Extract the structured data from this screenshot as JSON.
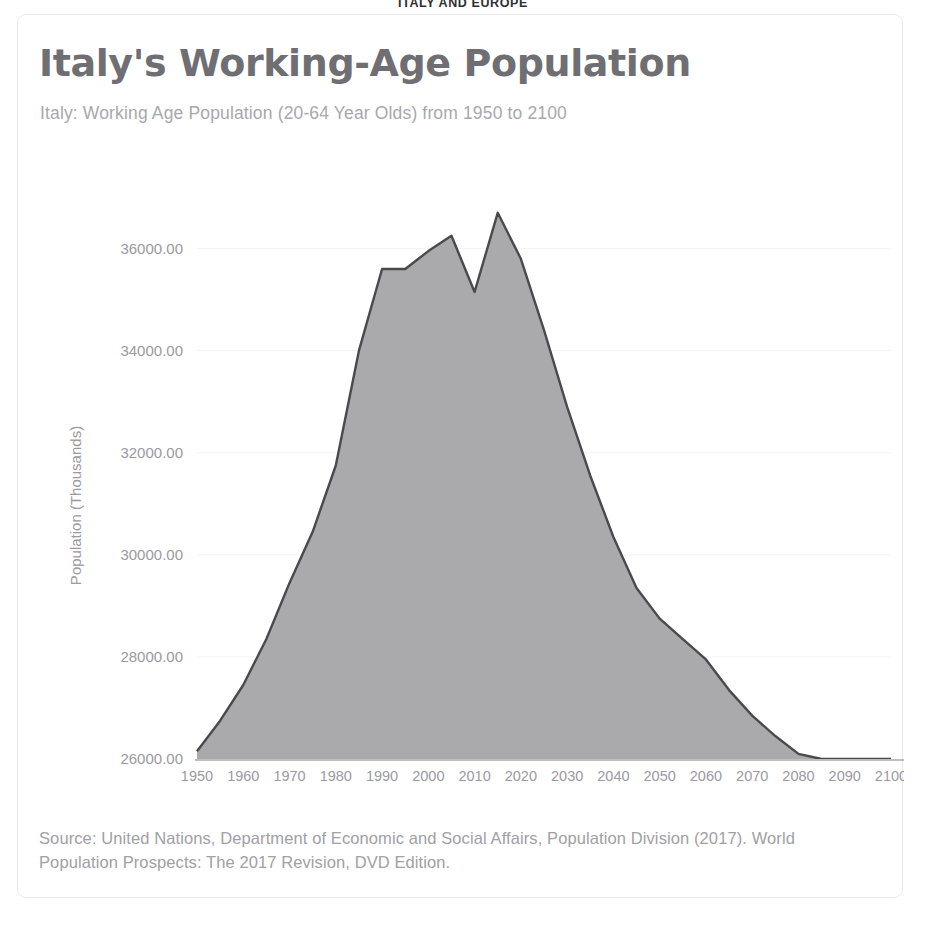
{
  "banner": {
    "text": "ITALY AND EUROPE"
  },
  "card": {
    "title": "Italy's Working-Age Population",
    "subtitle": "Italy: Working Age Population (20-64 Year Olds) from 1950 to 2100",
    "source": "Source: United Nations, Department of Economic and Social Affairs, Population Division (2017). World Population Prospects: The 2017 Revision, DVD Edition."
  },
  "colors": {
    "title": "#6e6e73",
    "subtitle": "#a8a8ad",
    "area_fill": "#a3a3a6",
    "line_stroke": "#4a4a4e",
    "axis": "#bdbdc2",
    "gridline": "#f4f4f6",
    "tick_text": "#9a9a9f",
    "card_border": "#e9e9ec",
    "background": "#ffffff"
  },
  "chart_data": {
    "type": "area",
    "title": "Italy's Working-Age Population",
    "subtitle": "Italy: Working Age Population (20-64 Year Olds) from 1950 to 2100",
    "xlabel": "",
    "ylabel": "Population (Thousands)",
    "xlim": [
      1950,
      2100
    ],
    "ylim": [
      26000,
      37500
    ],
    "grid": true,
    "legend": "none",
    "y_ticks": [
      26000,
      28000,
      30000,
      32000,
      34000,
      36000
    ],
    "y_tick_labels": [
      "26000.00",
      "28000.00",
      "30000.00",
      "32000.00",
      "34000.00",
      "36000.00"
    ],
    "x_ticks": [
      1950,
      1960,
      1970,
      1980,
      1990,
      2000,
      2010,
      2020,
      2030,
      2040,
      2050,
      2060,
      2070,
      2080,
      2090,
      2100
    ],
    "x_tick_labels": [
      "1950",
      "1960",
      "1970",
      "1980",
      "1990",
      "2000",
      "2010",
      "2020",
      "2030",
      "2040",
      "2050",
      "2060",
      "2070",
      "2080",
      "2090",
      "2100"
    ],
    "x": [
      1950,
      1955,
      1960,
      1965,
      1970,
      1975,
      1980,
      1985,
      1990,
      1995,
      2000,
      2005,
      2010,
      2015,
      2020,
      2025,
      2030,
      2035,
      2040,
      2045,
      2050,
      2055,
      2060,
      2065,
      2070,
      2075,
      2080,
      2085,
      2090,
      2095,
      2100
    ],
    "values": [
      26150,
      26750,
      27450,
      28350,
      29450,
      30450,
      31750,
      34000,
      35600,
      35600,
      35950,
      36250,
      35150,
      36700,
      35800,
      34400,
      32900,
      31550,
      30350,
      29350,
      28750,
      28350,
      27950,
      27350,
      26850,
      26450,
      26100,
      26000,
      26000,
      26000,
      26000
    ],
    "series": [
      {
        "name": "Italy working-age population (20-64)",
        "values": [
          26150,
          26750,
          27450,
          28350,
          29450,
          30450,
          31750,
          34000,
          35600,
          35600,
          35950,
          36250,
          35150,
          36700,
          35800,
          34400,
          32900,
          31550,
          30350,
          29350,
          28750,
          28350,
          27950,
          27350,
          26850,
          26450,
          26100,
          26000,
          26000,
          26000,
          26000
        ]
      }
    ]
  }
}
